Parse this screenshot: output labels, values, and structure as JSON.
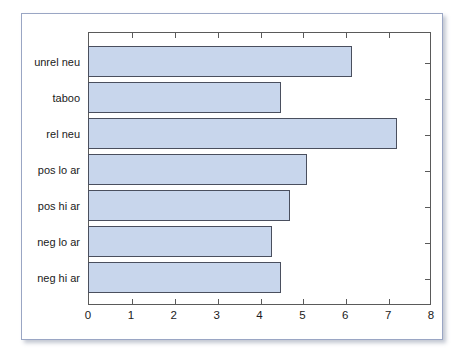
{
  "chart_data": {
    "type": "bar",
    "orientation": "horizontal",
    "title": "",
    "subtitle": "",
    "xlabel": "",
    "ylabel": "",
    "categories": [
      "neg hi ar",
      "neg lo ar",
      "pos hi ar",
      "pos lo ar",
      "rel neu",
      "taboo",
      "unrel neu"
    ],
    "values": [
      4.5,
      4.3,
      4.7,
      5.1,
      7.2,
      4.5,
      6.15
    ],
    "series": [
      {
        "name": "",
        "values": [
          4.5,
          4.3,
          4.7,
          5.1,
          7.2,
          4.5,
          6.15
        ]
      }
    ],
    "xlim": [
      0,
      8
    ],
    "xticks": [
      0,
      1,
      2,
      3,
      4,
      5,
      6,
      7,
      8
    ],
    "xtick_labels": [
      "0",
      "1",
      "2",
      "3",
      "4",
      "5",
      "6",
      "7",
      "8"
    ],
    "ytick_labels": [
      "neg hi ar",
      "neg lo ar",
      "pos hi ar",
      "pos lo ar",
      "rel neu",
      "taboo",
      "unrel neu"
    ],
    "grid": false,
    "legend": null,
    "legend_position": "none",
    "annotations": [],
    "bar_fill_color": "#c8d6ec",
    "bar_border_color": "#4a4f5e",
    "axis_color": "#5a5a5a",
    "frame_color": "#9aa6c4"
  }
}
